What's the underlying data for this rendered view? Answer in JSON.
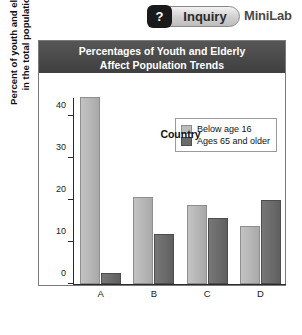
{
  "header": {
    "badge_icon": "question-mark-icon",
    "badge_symbol": "?",
    "inquiry_label": "Inquiry",
    "minilab_label": "MiniLab"
  },
  "chart_data": {
    "type": "bar",
    "title": "Percentages of Youth and Elderly Affect Population Trends",
    "title_line1": "Percentages of Youth and Elderly",
    "title_line2": "Affect Population Trends",
    "xlabel": "Country",
    "ylabel": "Percent of youth and elderly in the total population",
    "ylabel_line1": "Percent of youth and elderly",
    "ylabel_line2": "in the total population",
    "categories": [
      "A",
      "B",
      "C",
      "D"
    ],
    "yticks": [
      0,
      10,
      20,
      30,
      40
    ],
    "ylim": [
      0,
      44.5
    ],
    "grid": false,
    "legend_position": "top-right-inside",
    "series": [
      {
        "name": "Below age 16",
        "color": "#bcbcbc",
        "values": [
          44.5,
          20.8,
          18.8,
          13.7
        ]
      },
      {
        "name": "Ages 65 and older",
        "color": "#6b6b6b",
        "values": [
          2.7,
          11.8,
          15.8,
          20.0
        ]
      }
    ]
  }
}
